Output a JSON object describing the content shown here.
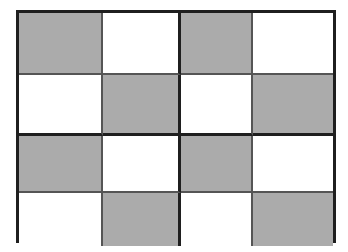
{
  "figure": {
    "kind": "checkerboard-grid",
    "rows": 4,
    "columns": 4,
    "quadrant_rows": 2,
    "quadrant_columns": 2,
    "colors": {
      "shaded_cell": "#ababab",
      "empty_cell": "#ffffff",
      "outer_border": "#1f1f1f",
      "thick_divider": "#1f1f1f",
      "thin_divider": "#555555",
      "page_background": "#ffffff"
    },
    "grid": [
      [
        "gray",
        "white",
        "gray",
        "white"
      ],
      [
        "white",
        "gray",
        "white",
        "gray"
      ],
      [
        "gray",
        "white",
        "gray",
        "white"
      ],
      [
        "white",
        "gray",
        "white",
        "gray"
      ]
    ],
    "cells": [
      {
        "row": 1,
        "col": 1,
        "shade": "gray",
        "label": ""
      },
      {
        "row": 1,
        "col": 2,
        "shade": "white",
        "label": ""
      },
      {
        "row": 1,
        "col": 3,
        "shade": "gray",
        "label": ""
      },
      {
        "row": 1,
        "col": 4,
        "shade": "white",
        "label": ""
      },
      {
        "row": 2,
        "col": 1,
        "shade": "white",
        "label": ""
      },
      {
        "row": 2,
        "col": 2,
        "shade": "gray",
        "label": ""
      },
      {
        "row": 2,
        "col": 3,
        "shade": "white",
        "label": ""
      },
      {
        "row": 2,
        "col": 4,
        "shade": "gray",
        "label": ""
      },
      {
        "row": 3,
        "col": 1,
        "shade": "gray",
        "label": ""
      },
      {
        "row": 3,
        "col": 2,
        "shade": "white",
        "label": ""
      },
      {
        "row": 3,
        "col": 3,
        "shade": "gray",
        "label": ""
      },
      {
        "row": 3,
        "col": 4,
        "shade": "white",
        "label": ""
      },
      {
        "row": 4,
        "col": 1,
        "shade": "white",
        "label": ""
      },
      {
        "row": 4,
        "col": 2,
        "shade": "gray",
        "label": ""
      },
      {
        "row": 4,
        "col": 3,
        "shade": "white",
        "label": ""
      },
      {
        "row": 4,
        "col": 4,
        "shade": "gray",
        "label": ""
      }
    ]
  }
}
